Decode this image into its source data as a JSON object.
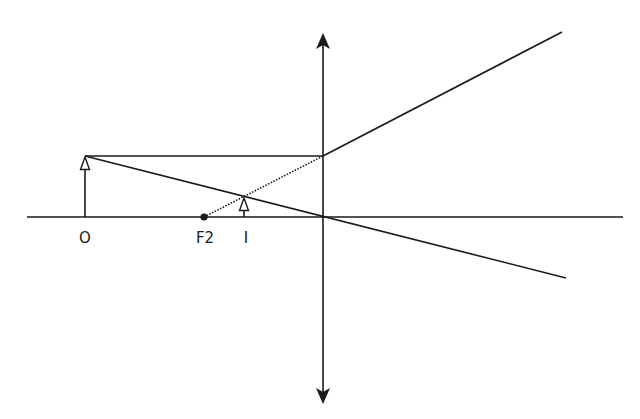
{
  "diagram": {
    "type": "ray-diagram-converging-lens",
    "stroke_color": "#1a1a1a",
    "labels": {
      "object": "O",
      "focal_point": "F2",
      "image": "I"
    },
    "geometry": {
      "principal_axis": {
        "x1": 27,
        "y1": 217,
        "x2": 623,
        "y2": 217
      },
      "lens": {
        "x": 323,
        "y_top": 33,
        "y_bottom": 404
      },
      "object_arrow": {
        "x": 85,
        "y_base": 217,
        "y_tip": 156
      },
      "image_arrow": {
        "x": 244,
        "y_base": 217,
        "y_tip": 197
      },
      "focal_point": {
        "x": 204,
        "y": 217
      },
      "parallel_ray": {
        "x1": 85,
        "y1": 156,
        "x2": 323,
        "y2": 156
      },
      "refracted_ray": {
        "x1": 323,
        "y1": 156,
        "x2": 562,
        "y2": 32
      },
      "virtual_extension": {
        "x1": 204,
        "y1": 217,
        "x2": 323,
        "y2": 156
      },
      "central_ray": {
        "x1": 85,
        "y1": 156,
        "x2": 566,
        "y2": 278
      }
    }
  }
}
